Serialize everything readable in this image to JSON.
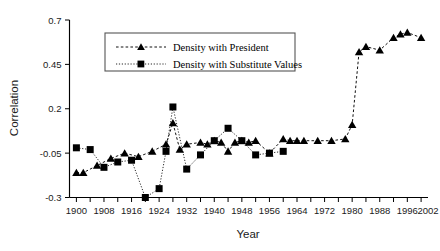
{
  "chart_data": {
    "type": "line",
    "title": "",
    "xlabel": "Year",
    "ylabel": "Correlation",
    "grid": false,
    "legend_position": "top-center",
    "xlim": [
      1898,
      2002
    ],
    "ylim": [
      -0.3,
      0.7
    ],
    "yticks": [
      "0.7",
      "0.45",
      "0.2",
      "-0.05",
      "-0.3"
    ],
    "ytick_values": [
      0.7,
      0.45,
      0.2,
      -0.05,
      -0.3
    ],
    "xticks": [
      "1900",
      "1908",
      "1916",
      "1924",
      "1932",
      "1940",
      "1948",
      "1956",
      "1964",
      "1972",
      "1980",
      "1988",
      "1996",
      "2002"
    ],
    "xtick_values": [
      1900,
      1908,
      1916,
      1924,
      1932,
      1940,
      1948,
      1956,
      1964,
      1972,
      1980,
      1988,
      1996,
      2002
    ],
    "xtick_minor_step": 4,
    "series": [
      {
        "name": "Density with President",
        "marker": "triangle",
        "linestyle": "dashed",
        "color": "#000000",
        "x": [
          1900,
          1902,
          1906,
          1910,
          1914,
          1918,
          1922,
          1926,
          1928,
          1930,
          1932,
          1936,
          1938,
          1940,
          1942,
          1944,
          1946,
          1948,
          1950,
          1952,
          1956,
          1960,
          1962,
          1964,
          1966,
          1970,
          1974,
          1978,
          1980,
          1982,
          1984,
          1988,
          1992,
          1994,
          1996,
          2000
        ],
        "y": [
          -0.16,
          -0.16,
          -0.12,
          -0.08,
          -0.05,
          -0.07,
          -0.04,
          0.0,
          0.12,
          -0.03,
          0.0,
          0.01,
          0.0,
          0.02,
          0.01,
          -0.04,
          0.01,
          0.02,
          0.01,
          0.02,
          -0.05,
          0.03,
          0.02,
          0.02,
          0.02,
          0.02,
          0.02,
          0.03,
          0.11,
          0.52,
          0.55,
          0.53,
          0.6,
          0.62,
          0.63,
          0.6
        ]
      },
      {
        "name": "Density with Substitute Values",
        "marker": "square",
        "linestyle": "dotted",
        "color": "#000000",
        "x": [
          1900,
          1904,
          1908,
          1912,
          1916,
          1920,
          1924,
          1926,
          1928,
          1932,
          1936,
          1940,
          1944,
          1948,
          1952,
          1956,
          1960
        ],
        "y": [
          -0.02,
          -0.03,
          -0.13,
          -0.1,
          -0.09,
          -0.3,
          -0.25,
          -0.04,
          0.21,
          -0.14,
          -0.06,
          0.02,
          0.09,
          0.02,
          -0.06,
          -0.05,
          -0.04
        ]
      }
    ]
  },
  "legend": {
    "entries": [
      {
        "label": "Density with President",
        "marker": "triangle"
      },
      {
        "label": "Density with Substitute Values",
        "marker": "square"
      }
    ]
  },
  "axes": {
    "y_title": "Correlation",
    "x_title": "Year"
  }
}
